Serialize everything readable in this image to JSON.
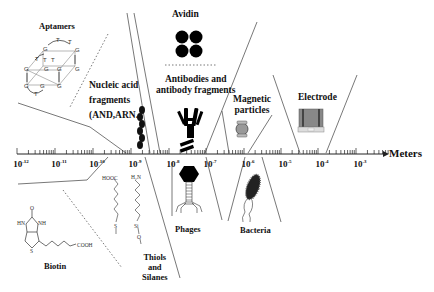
{
  "diagram": {
    "type": "length-scale diagram of biorecognition elements",
    "axis": {
      "unit_label": "Meters",
      "ticks": [
        {
          "base": "10",
          "exp": "-12",
          "x": 17
        },
        {
          "base": "10",
          "exp": "-11",
          "x": 55
        },
        {
          "base": "10",
          "exp": "-10",
          "x": 93
        },
        {
          "base": "10",
          "exp": "-9",
          "x": 131
        },
        {
          "base": "10",
          "exp": "-8",
          "x": 169
        },
        {
          "base": "10",
          "exp": "-7",
          "x": 206
        },
        {
          "base": "10",
          "exp": "-6",
          "x": 244
        },
        {
          "base": "10",
          "exp": "-5",
          "x": 281
        },
        {
          "base": "10",
          "exp": "-4",
          "x": 318
        },
        {
          "base": "10",
          "exp": "-3",
          "x": 356
        }
      ]
    },
    "labels": {
      "aptamers": "Aptamers",
      "nucleic_line1": "Nucleic acid",
      "nucleic_line2": "fragments",
      "nucleic_line3": "(AND,ARN...",
      "avidin": "Avidin",
      "antibodies_line1": "Antibodies and",
      "antibodies_line2": "antibody fragments",
      "magnetic_line1": "Magnetic",
      "magnetic_line2": "particles",
      "electrode": "Electrode",
      "biotin": "Biotin",
      "thiols_line1": "Thiols",
      "thiols_line2": "and",
      "thiols_line3": "Silanes",
      "phages": "Phages",
      "bacteria": "Bacteria"
    },
    "chem_text": {
      "hooc": "HOOC",
      "h2n": "H₂N",
      "s": "S",
      "si": "Si",
      "o": "O",
      "hn": "HN",
      "nh": "NH",
      "cooh": "COOH",
      "carbonyl_o": "O",
      "ring_s": "S"
    },
    "aptamer_bases": [
      "T",
      "T",
      "G",
      "G",
      "T",
      "T",
      "G",
      "G",
      "G",
      "G",
      "G",
      "T",
      "G",
      "G"
    ],
    "icons": [
      "aptamer-g-quadruplex-icon",
      "dna-helix-icon",
      "avidin-tetramer-icon",
      "antibody-icon",
      "antibody-fragment-icon",
      "magnetic-particle-icon",
      "electrode-icon",
      "biotin-structure-icon",
      "thiol-chain-icon",
      "silane-chain-icon",
      "phage-icon",
      "bacterium-icon"
    ]
  }
}
